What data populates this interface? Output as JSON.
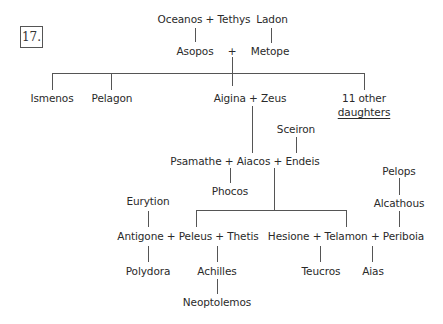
{
  "figure": {
    "number_label": "17."
  },
  "nodes": {
    "oceanos_tethys": "Oceanos + Tethys",
    "ladon": "Ladon",
    "asopos": "Asopos",
    "asopos_plus": "+",
    "metope": "Metope",
    "ismenos": "Ismenos",
    "pelagon": "Pelagon",
    "aigina_zeus": "Aigina + Zeus",
    "other_daughters_line1": "11 other",
    "other_daughters_line2": "daughters",
    "sceiron": "Sceiron",
    "psamathe_aiacos_endeis": "Psamathe + Aiacos + Endeis",
    "phocos": "Phocos",
    "eurytion": "Eurytion",
    "pelops": "Pelops",
    "alcathous": "Alcathous",
    "antigone_peleus_thetis": "Antigone + Peleus + Thetis",
    "hesione_telamon_periboia": "Hesione + Telamon + Periboia",
    "polydora": "Polydora",
    "achilles": "Achilles",
    "teucros": "Teucros",
    "aias": "Aias",
    "neoptolemos": "Neoptolemos"
  },
  "edges": [
    [
      "Oceanos + Tethys",
      "Asopos"
    ],
    [
      "Ladon",
      "Metope"
    ],
    [
      "Asopos + Metope",
      "Ismenos"
    ],
    [
      "Asopos + Metope",
      "Pelagon"
    ],
    [
      "Asopos + Metope",
      "Aigina"
    ],
    [
      "Asopos + Metope",
      "11 other daughters"
    ],
    [
      "Aigina + Zeus",
      "Aiacos"
    ],
    [
      "Sceiron",
      "Endeis"
    ],
    [
      "Psamathe + Aiacos",
      "Phocos"
    ],
    [
      "Aiacos + Endeis",
      "Peleus"
    ],
    [
      "Aiacos + Endeis",
      "Telamon"
    ],
    [
      "Eurytion",
      "Antigone"
    ],
    [
      "Pelops",
      "Alcathous"
    ],
    [
      "Alcathous",
      "Periboia"
    ],
    [
      "Antigone + Peleus",
      "Polydora"
    ],
    [
      "Peleus + Thetis",
      "Achilles"
    ],
    [
      "Achilles",
      "Neoptolemos"
    ],
    [
      "Hesione + Telamon",
      "Teucros"
    ],
    [
      "Telamon + Periboia",
      "Aias"
    ]
  ]
}
